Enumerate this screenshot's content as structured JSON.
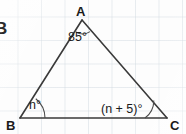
{
  "figure": {
    "type": "geometry-diagram",
    "shape": "triangle",
    "background": "graph-paper",
    "ink_color": "#3a3a3a",
    "text_color": "#1a1a1a",
    "grid_color": "#cdd6de",
    "edge_fragment_text": "B",
    "vertices": [
      {
        "id": "A",
        "label": "A",
        "x": 82,
        "y": 20
      },
      {
        "id": "B",
        "label": "B",
        "x": 20,
        "y": 118
      },
      {
        "id": "C",
        "label": "C",
        "x": 167,
        "y": 118
      }
    ],
    "sides": [
      {
        "name": "AB",
        "from": "A",
        "to": "B"
      },
      {
        "name": "AC",
        "from": "A",
        "to": "C"
      },
      {
        "name": "BC",
        "from": "B",
        "to": "C"
      }
    ],
    "angles": [
      {
        "at": "A",
        "label": "85°",
        "value": 85,
        "arc": true
      },
      {
        "at": "B",
        "label": "n°",
        "value": null,
        "expression": "n",
        "arc": true
      },
      {
        "at": "C",
        "label": "(n + 5)°",
        "value": null,
        "expression": "n + 5",
        "arc": true
      }
    ]
  }
}
